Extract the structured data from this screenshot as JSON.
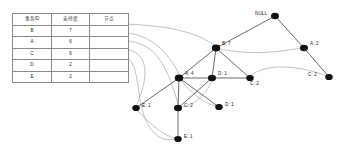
{
  "diagram": {
    "background": "#ffffff",
    "node_color": "#111111",
    "edge_color": "#3a3a3a",
    "link_color": "#b3b3b3",
    "border_color": "#8a8a8a"
  },
  "header_table": {
    "columns": [
      "事务ID",
      "支持度",
      "节点"
    ],
    "rows": [
      {
        "id": "B",
        "support": "7",
        "node": ""
      },
      {
        "id": "A",
        "support": "6",
        "node": ""
      },
      {
        "id": "C",
        "support": "6",
        "node": ""
      },
      {
        "id": "D",
        "support": "2",
        "node": ""
      },
      {
        "id": "E",
        "support": "2",
        "node": ""
      }
    ]
  },
  "tree": {
    "nodes": [
      {
        "key": "root",
        "label": "NULL",
        "x": 275,
        "y": 16,
        "r": 4.0,
        "label_dx": -20,
        "label_dy": -3.0,
        "anchor": "left"
      },
      {
        "key": "b7",
        "label": "B: 7",
        "x": 216,
        "y": 48,
        "r": 4.2,
        "label_dx": 6,
        "label_dy": -4.5,
        "anchor": "left"
      },
      {
        "key": "a2",
        "label": "A: 2",
        "x": 304,
        "y": 48,
        "r": 4.0,
        "label_dx": 6,
        "label_dy": -4.5,
        "anchor": "left"
      },
      {
        "key": "c2r",
        "label": "C: 2",
        "x": 329,
        "y": 77,
        "r": 3.8,
        "label_dx": -21,
        "label_dy": -2.5,
        "anchor": "left"
      },
      {
        "key": "a4",
        "label": "A: 4",
        "x": 179,
        "y": 78,
        "r": 4.2,
        "label_dx": 6,
        "label_dy": -4.5,
        "anchor": "left"
      },
      {
        "key": "d1m",
        "label": "D: 1",
        "x": 212,
        "y": 78,
        "r": 4.0,
        "label_dx": 6,
        "label_dy": -4.5,
        "anchor": "left"
      },
      {
        "key": "c2m",
        "label": "C: 2",
        "x": 250,
        "y": 78,
        "r": 3.8,
        "label_dx": 0,
        "label_dy": 5.0,
        "anchor": "left"
      },
      {
        "key": "e1l",
        "label": "E: 1",
        "x": 136,
        "y": 108,
        "r": 3.8,
        "label_dx": 6,
        "label_dy": -3.0,
        "anchor": "left"
      },
      {
        "key": "c2b",
        "label": "C: 2",
        "x": 178,
        "y": 108,
        "r": 4.0,
        "label_dx": 6,
        "label_dy": -3.0,
        "anchor": "left"
      },
      {
        "key": "d1b",
        "label": "D: 1",
        "x": 219,
        "y": 107,
        "r": 3.8,
        "label_dx": 6,
        "label_dy": -3.0,
        "anchor": "left"
      },
      {
        "key": "e1b",
        "label": "E: 1",
        "x": 178,
        "y": 139,
        "r": 3.8,
        "label_dx": 6,
        "label_dy": -3.0,
        "anchor": "left"
      }
    ],
    "edges": [
      {
        "from": "root",
        "to": "b7"
      },
      {
        "from": "root",
        "to": "a2"
      },
      {
        "from": "a2",
        "to": "c2r"
      },
      {
        "from": "b7",
        "to": "a4"
      },
      {
        "from": "b7",
        "to": "d1m"
      },
      {
        "from": "b7",
        "to": "c2m"
      },
      {
        "from": "a4",
        "to": "e1l"
      },
      {
        "from": "a4",
        "to": "c2b"
      },
      {
        "from": "a4",
        "to": "d1b"
      },
      {
        "from": "d1m",
        "to": "c2b"
      },
      {
        "from": "a4",
        "to": "c2m"
      },
      {
        "from": "c2b",
        "to": "e1b"
      }
    ],
    "node_links": [
      {
        "d": "M125,24 C170,26 196,32 216,46"
      },
      {
        "d": "M125,33 C150,34 168,52 179,74"
      },
      {
        "d": "M125,41 C152,42 166,60 178,104"
      },
      {
        "d": "M125,49 C148,52 150,74 137,104"
      },
      {
        "d": "M125,57 C142,62 134,104 150,128 C160,142 170,140 176,139"
      },
      {
        "d": "M216,48 C250,56 278,52 302,48"
      },
      {
        "d": "M250,76 C268,62 300,66 327,76"
      },
      {
        "d": "M179,78 C190,92 204,104 216,106"
      },
      {
        "d": "M212,80 C206,96 192,106 182,107"
      },
      {
        "d": "M137,110 C150,124 164,136 175,138"
      }
    ]
  }
}
